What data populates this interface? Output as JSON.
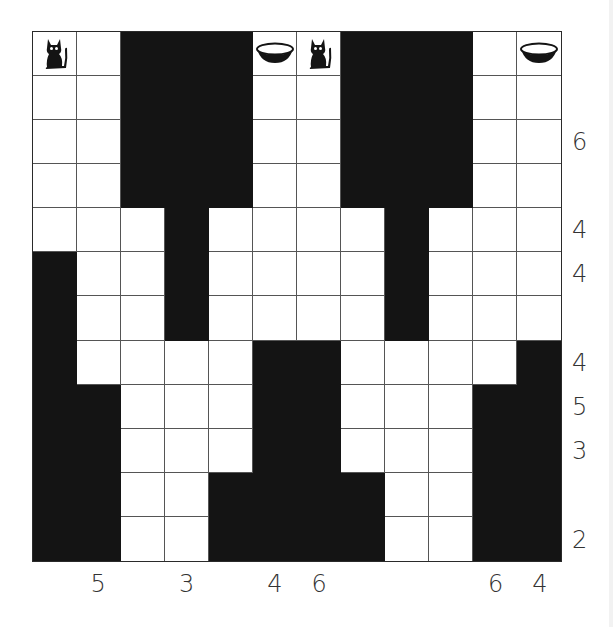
{
  "puzzle": {
    "rows": 12,
    "cols": 12,
    "colors": {
      "black": "#141414",
      "white": "#ffffff",
      "grid_line": "#555555",
      "clue_text": "#333333"
    },
    "grid": [
      [
        "W",
        "W",
        "B",
        "B",
        "B",
        "W",
        "W",
        "B",
        "B",
        "B",
        "W",
        "W"
      ],
      [
        "W",
        "W",
        "B",
        "B",
        "B",
        "W",
        "W",
        "B",
        "B",
        "B",
        "W",
        "W"
      ],
      [
        "W",
        "W",
        "B",
        "B",
        "B",
        "W",
        "W",
        "B",
        "B",
        "B",
        "W",
        "W"
      ],
      [
        "W",
        "W",
        "B",
        "B",
        "B",
        "W",
        "W",
        "B",
        "B",
        "B",
        "W",
        "W"
      ],
      [
        "W",
        "W",
        "W",
        "B",
        "W",
        "W",
        "W",
        "W",
        "B",
        "W",
        "W",
        "W"
      ],
      [
        "B",
        "W",
        "W",
        "B",
        "W",
        "W",
        "W",
        "W",
        "B",
        "W",
        "W",
        "W"
      ],
      [
        "B",
        "W",
        "W",
        "B",
        "W",
        "W",
        "W",
        "W",
        "B",
        "W",
        "W",
        "W"
      ],
      [
        "B",
        "W",
        "W",
        "W",
        "W",
        "B",
        "B",
        "W",
        "W",
        "W",
        "W",
        "B"
      ],
      [
        "B",
        "B",
        "W",
        "W",
        "W",
        "B",
        "B",
        "W",
        "W",
        "W",
        "B",
        "B"
      ],
      [
        "B",
        "B",
        "W",
        "W",
        "W",
        "B",
        "B",
        "W",
        "W",
        "W",
        "B",
        "B"
      ],
      [
        "B",
        "B",
        "W",
        "W",
        "B",
        "B",
        "B",
        "B",
        "W",
        "W",
        "B",
        "B"
      ],
      [
        "B",
        "B",
        "W",
        "W",
        "B",
        "B",
        "B",
        "B",
        "W",
        "W",
        "B",
        "B"
      ]
    ],
    "icons": [
      {
        "row": 0,
        "col": 0,
        "type": "cat-icon"
      },
      {
        "row": 0,
        "col": 5,
        "type": "bowl-icon"
      },
      {
        "row": 0,
        "col": 6,
        "type": "cat-icon"
      },
      {
        "row": 0,
        "col": 11,
        "type": "bowl-icon"
      }
    ],
    "row_clues": [
      {
        "row": 2,
        "value": "6"
      },
      {
        "row": 4,
        "value": "4"
      },
      {
        "row": 5,
        "value": "4"
      },
      {
        "row": 7,
        "value": "4"
      },
      {
        "row": 8,
        "value": "5"
      },
      {
        "row": 9,
        "value": "3"
      },
      {
        "row": 11,
        "value": "2"
      }
    ],
    "col_clues": [
      {
        "col": 1,
        "value": "5"
      },
      {
        "col": 3,
        "value": "3"
      },
      {
        "col": 5,
        "value": "4"
      },
      {
        "col": 6,
        "value": "6"
      },
      {
        "col": 10,
        "value": "6"
      },
      {
        "col": 11,
        "value": "4"
      }
    ]
  }
}
